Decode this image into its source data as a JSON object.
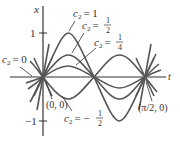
{
  "figure": {
    "axes": {
      "x_label": "x",
      "t_label": "t",
      "tick_pos": "1",
      "tick_neg": "−1"
    },
    "points": {
      "origin": "(0, 0)",
      "half_pi": "(π/2, 0)"
    },
    "curve_labels": {
      "c1_var": "c",
      "c1_sub": "2",
      "c1_rhs": "= 1",
      "chalf_var": "c",
      "chalf_sub": "2",
      "chalf_eq": "=",
      "chalf_num": "1",
      "chalf_den": "2",
      "cquarter_var": "c",
      "cquarter_sub": "2",
      "cquarter_eq": "=",
      "cquarter_num": "1",
      "cquarter_den": "4",
      "c0_var": "c",
      "c0_sub": "2",
      "c0_rhs": "= 0",
      "cneg_var": "c",
      "cneg_sub": "2",
      "cneg_eq": "= −",
      "cneg_num": "1",
      "cneg_den": "2"
    },
    "colors": {
      "curve": "#555555",
      "axis": "#333333"
    }
  }
}
